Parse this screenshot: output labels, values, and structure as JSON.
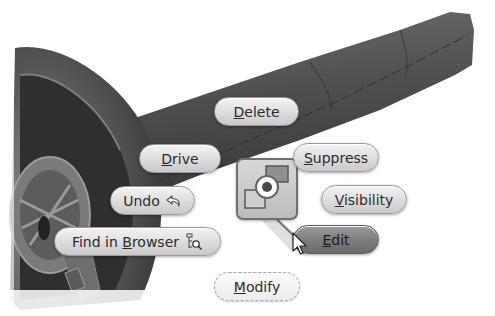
{
  "app": "3D CAD modeling viewport with marking menu",
  "marking_menu": {
    "items": [
      {
        "id": "delete",
        "label_pre": "",
        "accel": "D",
        "label_post": "elete",
        "label": "Delete"
      },
      {
        "id": "drive",
        "label_pre": "",
        "accel": "D",
        "label_post": "rive",
        "label": "Drive"
      },
      {
        "id": "suppress",
        "label_pre": "",
        "accel": "S",
        "label_post": "uppress",
        "label": "Suppress"
      },
      {
        "id": "undo",
        "label_pre": "Undo",
        "accel": "",
        "label_post": "",
        "label": "Undo",
        "icon": "undo-arrow-icon"
      },
      {
        "id": "visibility",
        "label_pre": "",
        "accel": "V",
        "label_post": "isibility",
        "label": "Visibility"
      },
      {
        "id": "find_in_browser",
        "label_pre": "Find in ",
        "accel": "B",
        "label_post": "rowser",
        "label": "Find in Browser",
        "icon": "find-in-browser-icon"
      },
      {
        "id": "edit",
        "label_pre": "",
        "accel": "E",
        "label_post": "dit",
        "label": "Edit",
        "state": "hover"
      },
      {
        "id": "modify",
        "label_pre": "",
        "accel": "M",
        "label_post": "odify",
        "label": "Modify",
        "style": "dashed"
      }
    ],
    "center_icon": "part-feature-icon"
  },
  "colors": {
    "background": "#ffffff",
    "model_dark": "#3a3a3a",
    "model_mid": "#5e5e5e",
    "button_face": "#dcdcdc",
    "button_hover": "#7c7c7c"
  }
}
